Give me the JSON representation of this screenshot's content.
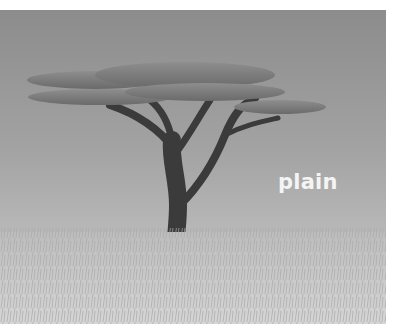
{
  "image": {
    "description": "Illustration of an acacia tree standing in tall grass under a grey sky",
    "caption": "plain"
  },
  "colors": {
    "sky_top": "#8c8c8c",
    "sky_bottom": "#c4c4c4",
    "trunk": "#3a3a3a",
    "canopy": "#7a7a7a",
    "grass": "#cfcfcf",
    "caption": "#f4f4f4"
  }
}
